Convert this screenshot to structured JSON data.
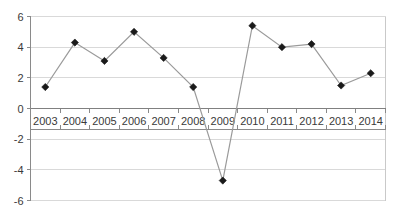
{
  "chart_data": {
    "type": "line",
    "title": "",
    "subtitle": "",
    "xlabel": "",
    "ylabel": "",
    "categories": [
      "2003",
      "2004",
      "2005",
      "2006",
      "2007",
      "2008",
      "2009",
      "2010",
      "2011",
      "2012",
      "2013",
      "2014"
    ],
    "values": [
      1.4,
      4.3,
      3.1,
      5.0,
      3.3,
      1.4,
      -4.7,
      5.4,
      4.0,
      4.2,
      1.5,
      2.3
    ],
    "series": [
      {
        "name": "series-1",
        "values": [
          1.4,
          4.3,
          3.1,
          5.0,
          3.3,
          1.4,
          -4.7,
          5.4,
          4.0,
          4.2,
          1.5,
          2.3
        ]
      }
    ],
    "ylim": [
      -6,
      6
    ],
    "yticks": [
      6,
      4,
      2,
      0,
      -2,
      -4,
      -6
    ],
    "ytick_labels": [
      "6",
      "4",
      "2",
      "0",
      "-2",
      "-4",
      "-6"
    ],
    "xtick_labels": [
      "2003",
      "2004",
      "2005",
      "2006",
      "2007",
      "2008",
      "2009",
      "2010",
      "2011",
      "2012",
      "2013",
      "2014"
    ],
    "grid": true,
    "legend": false,
    "legend_position": "none",
    "marker": "diamond",
    "line_color": "#9a9a9a",
    "marker_color": "#1a1a1a",
    "grid_color": "#d9d9d9",
    "zero_line_color": "#808080",
    "axis_color": "#8a8a8a",
    "background_color": "#ffffff",
    "annotations": []
  }
}
